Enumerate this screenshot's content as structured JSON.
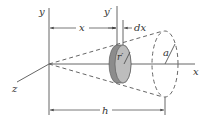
{
  "diagram": {
    "type": "cone-volume-by-disks",
    "labels": {
      "y_axis": "y",
      "y_prime": "y′",
      "x_axis": "x",
      "z_axis": "z",
      "x_distance": "x",
      "dx": "dx",
      "r_prime": "r′",
      "a": "a",
      "h": "h"
    },
    "colors": {
      "line": "#555555",
      "disk_face": "#b9b9b9",
      "disk_side": "#8c8c8c",
      "background": "#ffffff"
    }
  }
}
